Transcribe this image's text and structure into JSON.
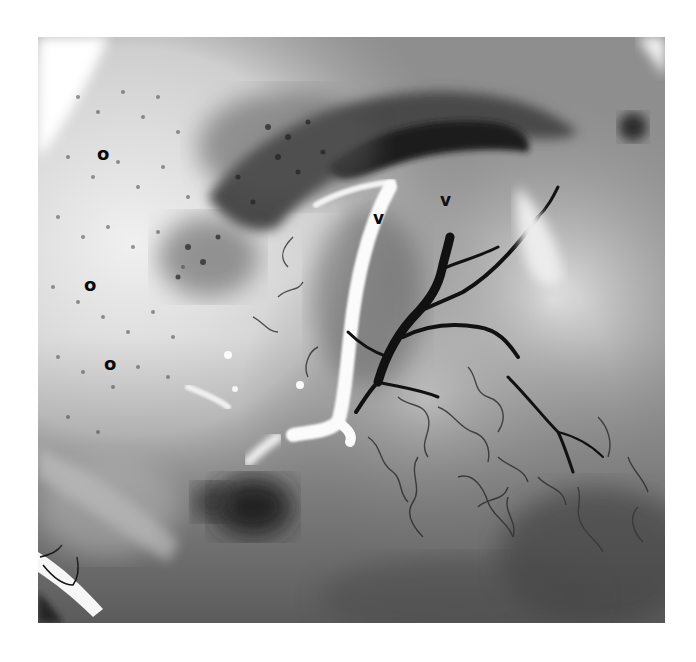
{
  "figure": {
    "labels": [
      {
        "text": "o",
        "x": 97,
        "y": 145
      },
      {
        "text": "o",
        "x": 84,
        "y": 276
      },
      {
        "text": "o",
        "x": 104,
        "y": 355
      },
      {
        "text": "v",
        "x": 373,
        "y": 210
      },
      {
        "text": "v",
        "x": 440,
        "y": 192
      }
    ],
    "colors": {
      "background": "#ffffff",
      "tissue_light": "#d8d8d8",
      "tissue_mid": "#8c8c8c",
      "tissue_dark": "#3a3a3a",
      "vessel_dark": "#111111",
      "vessel_white": "#fafafa"
    }
  }
}
